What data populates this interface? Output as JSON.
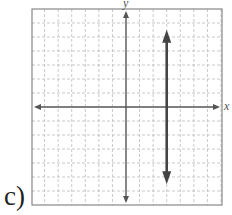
{
  "problem_label": "c)",
  "chart_data": {
    "type": "line",
    "title": "",
    "xlabel": "x",
    "ylabel": "y",
    "xlim": [
      -7,
      7
    ],
    "ylim": [
      -7,
      7
    ],
    "grid": true,
    "grid_step": 1,
    "series": [
      {
        "name": "vertical line x = 3",
        "equation": "x = 3",
        "x": [
          3,
          3
        ],
        "y": [
          5.3,
          -5.3
        ],
        "arrows_both_ends": true
      }
    ]
  },
  "colors": {
    "axis": "#555555",
    "grid": "#bbbbbb",
    "line": "#444444",
    "frame": "#888888"
  }
}
